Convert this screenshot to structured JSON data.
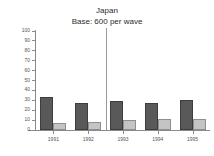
{
  "chart_data": {
    "type": "bar",
    "title": "Japan",
    "subtitle": "Base: 600 per wave",
    "xlabel": "",
    "ylabel": "",
    "ylim": [
      0,
      100
    ],
    "yticks": [
      0,
      10,
      20,
      30,
      40,
      50,
      60,
      70,
      80,
      90,
      100
    ],
    "ytick_labels": [
      "0",
      "10",
      "20",
      "30",
      "40",
      "50",
      "60",
      "70",
      "80",
      "90",
      "100"
    ],
    "categories": [
      "1991",
      "1992",
      "1993",
      "1994",
      "1995"
    ],
    "grid": false,
    "legend": "none",
    "series": [
      {
        "name": "series-1",
        "color": "#595959",
        "values": [
          33,
          27,
          29,
          27,
          30
        ]
      },
      {
        "name": "series-2",
        "color": "#c4c4c4",
        "values": [
          7,
          8,
          10,
          11,
          11
        ]
      }
    ],
    "annotations": [
      {
        "type": "vertical-divider",
        "after_category": "1992",
        "color": "#9a9a9a"
      }
    ]
  }
}
